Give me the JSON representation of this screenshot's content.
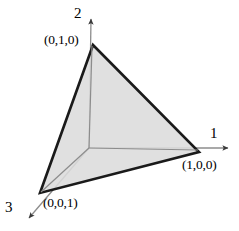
{
  "figure": {
    "kind": "geometry-diagram",
    "background_color": "#ffffff"
  },
  "colors": {
    "simplex_fill": "#dcdcdc",
    "simplex_edge": "#1a1a1a",
    "axis_line": "#8c8c8c",
    "label_text": "#000000"
  },
  "axes": [
    {
      "id": "axis-1",
      "label": "1",
      "direction": "right",
      "origin": [
        89,
        148
      ],
      "tip": [
        233,
        148
      ]
    },
    {
      "id": "axis-2",
      "label": "2",
      "direction": "up",
      "origin": [
        89,
        148
      ],
      "tip": [
        91,
        14
      ]
    },
    {
      "id": "axis-3",
      "label": "3",
      "direction": "down-left",
      "origin": [
        89,
        148
      ],
      "tip": [
        24,
        223
      ]
    }
  ],
  "vertices": [
    {
      "id": "vertex-010",
      "label": "(0,1,0)",
      "point": [
        93,
        45
      ],
      "on_axis": "2"
    },
    {
      "id": "vertex-100",
      "label": "(1,0,0)",
      "point": [
        199,
        152
      ],
      "on_axis": "1"
    },
    {
      "id": "vertex-001",
      "label": "(0,0,1)",
      "point": [
        40,
        193
      ],
      "on_axis": "3"
    }
  ],
  "simplex": {
    "polygon_points": "93,45 199,152 40,193",
    "fill": "#dcdcdc",
    "stroke": "#1a1a1a",
    "stroke_width": 2.6
  }
}
